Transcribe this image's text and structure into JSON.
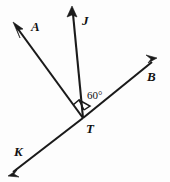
{
  "figure": {
    "background_color": "#fdfdfd",
    "stroke_color": "#1a1a1a",
    "width": 170,
    "height": 182
  },
  "vertex": {
    "name": "T",
    "label": "T",
    "x": 83,
    "y": 118,
    "label_x": 86,
    "label_y": 133
  },
  "rays": [
    {
      "id": "TA",
      "label": "A",
      "from_x": 83,
      "from_y": 118,
      "to_x": 14,
      "to_y": 23,
      "label_x": 31,
      "label_y": 31,
      "arrow_angle_deg": 234
    },
    {
      "id": "TJ",
      "label": "J",
      "from_x": 83,
      "from_y": 118,
      "to_x": 72,
      "to_y": 8,
      "label_x": 82,
      "label_y": 25,
      "arrow_angle_deg": 275
    },
    {
      "id": "TB",
      "label": "B",
      "from_x": 83,
      "from_y": 118,
      "to_x": 156,
      "to_y": 59,
      "label_x": 147,
      "label_y": 81,
      "arrow_angle_deg": 321
    },
    {
      "id": "TK",
      "label": "K",
      "from_x": 83,
      "from_y": 118,
      "to_x": 9,
      "to_y": 175,
      "label_x": 14,
      "label_y": 156,
      "arrow_angle_deg": 142
    }
  ],
  "angles": [
    {
      "id": "ATJ",
      "type": "right-angle-square",
      "label": "",
      "marked": true
    },
    {
      "id": "JTB",
      "type": "arc",
      "label": "60°",
      "label_x": 86,
      "label_y": 99,
      "marked": true
    }
  ]
}
